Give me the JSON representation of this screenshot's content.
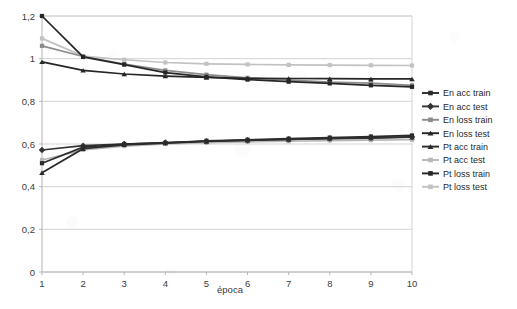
{
  "chart_data": {
    "type": "line",
    "title": "",
    "xlabel": "época",
    "ylabel": "",
    "x": [
      1,
      2,
      3,
      4,
      5,
      6,
      7,
      8,
      9,
      10
    ],
    "xtick_labels": [
      "1",
      "2",
      "3",
      "4",
      "5",
      "6",
      "7",
      "8",
      "9",
      "10"
    ],
    "ytick_labels": [
      "0",
      "0,2",
      "0,4",
      "0,6",
      "0,8",
      "1",
      "1,2"
    ],
    "ytick_values": [
      0,
      0.2,
      0.4,
      0.6,
      0.8,
      1.0,
      1.2
    ],
    "ylim": [
      0,
      1.2
    ],
    "xlim": [
      1,
      10
    ],
    "grid": true,
    "legend_position": "right",
    "decimal_separator": ",",
    "series": [
      {
        "name": "En acc train",
        "marker": "square",
        "color": "#2b2b2b",
        "values": [
          0.51,
          0.585,
          0.6,
          0.605,
          0.615,
          0.62,
          0.625,
          0.63,
          0.635,
          0.64
        ]
      },
      {
        "name": "En acc test",
        "marker": "diamond",
        "color": "#333333",
        "values": [
          0.572,
          0.592,
          0.6,
          0.607,
          0.613,
          0.618,
          0.622,
          0.626,
          0.63,
          0.633
        ]
      },
      {
        "name": "En loss train",
        "marker": "square",
        "color": "#8c8c8c",
        "values": [
          1.06,
          1.01,
          0.975,
          0.945,
          0.925,
          0.91,
          0.9,
          0.89,
          0.885,
          0.875
        ]
      },
      {
        "name": "En loss test",
        "marker": "triangle",
        "color": "#262626",
        "values": [
          0.985,
          0.945,
          0.928,
          0.918,
          0.912,
          0.908,
          0.907,
          0.906,
          0.905,
          0.905
        ]
      },
      {
        "name": "Pt acc train",
        "marker": "triangle",
        "color": "#2b2b2b",
        "values": [
          0.465,
          0.578,
          0.596,
          0.604,
          0.612,
          0.617,
          0.621,
          0.625,
          0.628,
          0.632
        ]
      },
      {
        "name": "Pt acc test",
        "marker": "square",
        "color": "#b8b8b8",
        "values": [
          0.525,
          0.572,
          0.59,
          0.6,
          0.606,
          0.61,
          0.613,
          0.616,
          0.618,
          0.62
        ]
      },
      {
        "name": "Pt loss train",
        "marker": "square",
        "color": "#262626",
        "values": [
          1.2,
          1.008,
          0.972,
          0.935,
          0.915,
          0.902,
          0.892,
          0.884,
          0.875,
          0.868
        ]
      },
      {
        "name": "Pt loss test",
        "marker": "square",
        "color": "#c2c2c2",
        "values": [
          1.095,
          1.012,
          0.995,
          0.982,
          0.976,
          0.973,
          0.971,
          0.97,
          0.969,
          0.968
        ]
      }
    ]
  },
  "legend": {
    "items": [
      {
        "label": "En acc train"
      },
      {
        "label": "En acc test"
      },
      {
        "label": "En loss train"
      },
      {
        "label": "En loss test"
      },
      {
        "label": "Pt acc train"
      },
      {
        "label": "Pt acc test"
      },
      {
        "label": "Pt loss train"
      },
      {
        "label": "Pt loss test"
      }
    ]
  },
  "style": {
    "grid_color": "#d4d4d4",
    "axis_color": "#b5b5b5",
    "plot_background": "#ffffff"
  }
}
